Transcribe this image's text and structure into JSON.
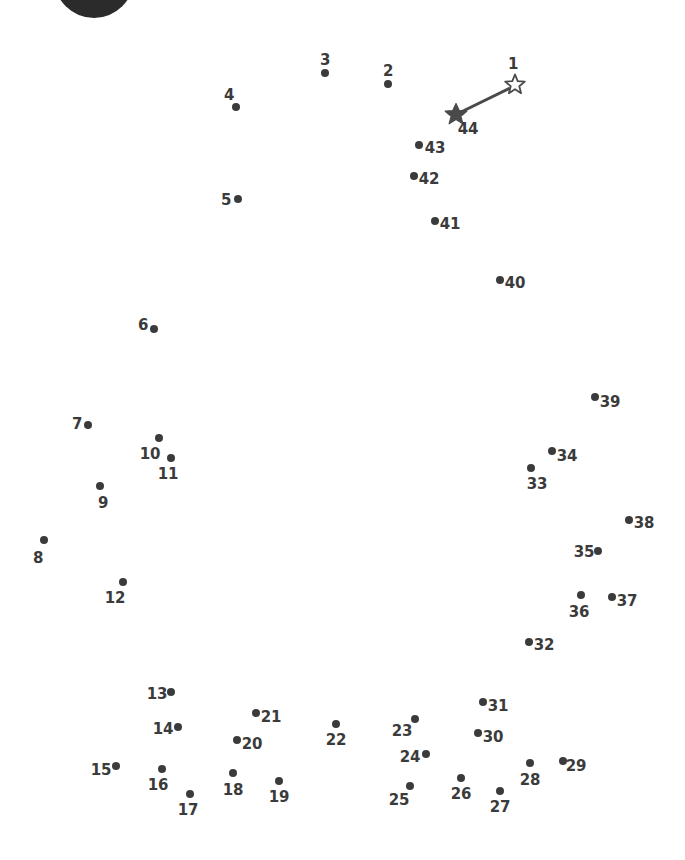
{
  "page": {
    "width": 685,
    "height": 860,
    "background_color": "#ffffff",
    "dot_color": "#3b3b3b",
    "label_color": "#3b3b3b",
    "line_color": "#4a4a4a"
  },
  "logo": {
    "name": "partial-dark-circle",
    "cx": 94,
    "cy": -22,
    "r": 40,
    "color": "#2b2b2b"
  },
  "start_marker": {
    "label": "1",
    "style": "hollow-star",
    "x": 515,
    "y": 84,
    "label_x": 513,
    "label_y": 64
  },
  "end_marker": {
    "label": "44",
    "style": "filled-star",
    "x": 456,
    "y": 114,
    "label_x": 468,
    "label_y": 129
  },
  "guide_line": {
    "from_x": 510,
    "from_y": 88,
    "to_x": 459,
    "to_y": 113,
    "has_arrowhead": true
  },
  "dots": [
    {
      "label": "2",
      "x": 388,
      "y": 84,
      "label_x": 388,
      "label_y": 71
    },
    {
      "label": "3",
      "x": 325,
      "y": 73,
      "label_x": 325,
      "label_y": 60
    },
    {
      "label": "4",
      "x": 236,
      "y": 107,
      "label_x": 229,
      "label_y": 95
    },
    {
      "label": "5",
      "x": 238,
      "y": 199,
      "label_x": 226,
      "label_y": 200
    },
    {
      "label": "6",
      "x": 154,
      "y": 329,
      "label_x": 143,
      "label_y": 325
    },
    {
      "label": "7",
      "x": 88,
      "y": 425,
      "label_x": 77,
      "label_y": 424
    },
    {
      "label": "8",
      "x": 44,
      "y": 540,
      "label_x": 38,
      "label_y": 558
    },
    {
      "label": "9",
      "x": 100,
      "y": 486,
      "label_x": 103,
      "label_y": 503
    },
    {
      "label": "10",
      "x": 159,
      "y": 438,
      "label_x": 150,
      "label_y": 454
    },
    {
      "label": "11",
      "x": 171,
      "y": 458,
      "label_x": 168,
      "label_y": 474
    },
    {
      "label": "12",
      "x": 123,
      "y": 582,
      "label_x": 115,
      "label_y": 598
    },
    {
      "label": "13",
      "x": 171,
      "y": 692,
      "label_x": 157,
      "label_y": 694
    },
    {
      "label": "14",
      "x": 178,
      "y": 727,
      "label_x": 163,
      "label_y": 729
    },
    {
      "label": "15",
      "x": 116,
      "y": 766,
      "label_x": 101,
      "label_y": 770
    },
    {
      "label": "16",
      "x": 162,
      "y": 769,
      "label_x": 158,
      "label_y": 785
    },
    {
      "label": "17",
      "x": 190,
      "y": 794,
      "label_x": 188,
      "label_y": 810
    },
    {
      "label": "18",
      "x": 233,
      "y": 773,
      "label_x": 233,
      "label_y": 790
    },
    {
      "label": "19",
      "x": 279,
      "y": 781,
      "label_x": 279,
      "label_y": 797
    },
    {
      "label": "20",
      "x": 237,
      "y": 740,
      "label_x": 252,
      "label_y": 744
    },
    {
      "label": "21",
      "x": 256,
      "y": 713,
      "label_x": 271,
      "label_y": 717
    },
    {
      "label": "22",
      "x": 336,
      "y": 724,
      "label_x": 336,
      "label_y": 740
    },
    {
      "label": "23",
      "x": 415,
      "y": 719,
      "label_x": 402,
      "label_y": 731
    },
    {
      "label": "24",
      "x": 426,
      "y": 754,
      "label_x": 410,
      "label_y": 757
    },
    {
      "label": "25",
      "x": 410,
      "y": 786,
      "label_x": 399,
      "label_y": 800
    },
    {
      "label": "26",
      "x": 461,
      "y": 778,
      "label_x": 461,
      "label_y": 794
    },
    {
      "label": "27",
      "x": 500,
      "y": 791,
      "label_x": 500,
      "label_y": 807
    },
    {
      "label": "28",
      "x": 530,
      "y": 763,
      "label_x": 530,
      "label_y": 780
    },
    {
      "label": "29",
      "x": 563,
      "y": 761,
      "label_x": 576,
      "label_y": 766
    },
    {
      "label": "30",
      "x": 478,
      "y": 733,
      "label_x": 493,
      "label_y": 737
    },
    {
      "label": "31",
      "x": 483,
      "y": 702,
      "label_x": 498,
      "label_y": 706
    },
    {
      "label": "32",
      "x": 529,
      "y": 642,
      "label_x": 544,
      "label_y": 645
    },
    {
      "label": "33",
      "x": 531,
      "y": 468,
      "label_x": 537,
      "label_y": 484
    },
    {
      "label": "34",
      "x": 552,
      "y": 451,
      "label_x": 567,
      "label_y": 456
    },
    {
      "label": "35",
      "x": 598,
      "y": 551,
      "label_x": 584,
      "label_y": 552
    },
    {
      "label": "36",
      "x": 581,
      "y": 595,
      "label_x": 579,
      "label_y": 612
    },
    {
      "label": "37",
      "x": 612,
      "y": 597,
      "label_x": 627,
      "label_y": 601
    },
    {
      "label": "38",
      "x": 629,
      "y": 520,
      "label_x": 644,
      "label_y": 523
    },
    {
      "label": "39",
      "x": 595,
      "y": 397,
      "label_x": 610,
      "label_y": 402
    },
    {
      "label": "40",
      "x": 500,
      "y": 280,
      "label_x": 515,
      "label_y": 283
    },
    {
      "label": "41",
      "x": 435,
      "y": 221,
      "label_x": 450,
      "label_y": 224
    },
    {
      "label": "42",
      "x": 414,
      "y": 176,
      "label_x": 429,
      "label_y": 179
    },
    {
      "label": "43",
      "x": 419,
      "y": 145,
      "label_x": 435,
      "label_y": 148
    }
  ]
}
